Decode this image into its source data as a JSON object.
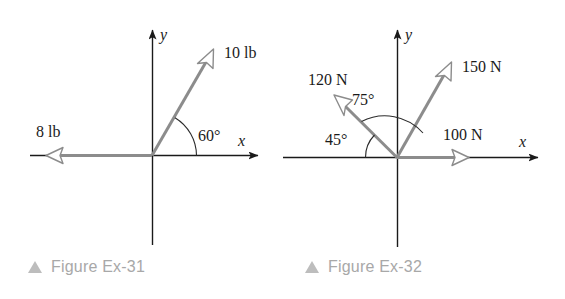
{
  "colors": {
    "axis": "#1a1a1a",
    "vector": "#8c8c8c",
    "arc": "#2b2b2b",
    "caption_text": "#a8a8a8",
    "caption_marker": "#bdbdbd",
    "background": "#ffffff",
    "label_text": "#1a1a1a"
  },
  "figures": [
    {
      "id": "figure-ex-31",
      "caption": "Figure Ex-31",
      "axes": {
        "x_label": "x",
        "y_label": "y"
      },
      "vectors": [
        {
          "name": "vector-10lb",
          "label": "10 lb",
          "magnitude": 10,
          "unit": "lb",
          "angle_deg": 60,
          "direction": "up-right"
        },
        {
          "name": "vector-8lb",
          "label": "8 lb",
          "magnitude": 8,
          "unit": "lb",
          "angle_deg": 180,
          "direction": "left"
        }
      ],
      "angles": [
        {
          "name": "angle-60",
          "label": "60°",
          "value": 60,
          "from": "positive-x-axis",
          "to": "vector-10lb"
        }
      ]
    },
    {
      "id": "figure-ex-32",
      "caption": "Figure Ex-32",
      "axes": {
        "x_label": "x",
        "y_label": "y"
      },
      "vectors": [
        {
          "name": "vector-150n",
          "label": "150 N",
          "magnitude": 150,
          "unit": "N",
          "angle_deg": 60,
          "direction": "up-right"
        },
        {
          "name": "vector-120n",
          "label": "120 N",
          "magnitude": 120,
          "unit": "N",
          "angle_deg": 135,
          "direction": "up-left"
        },
        {
          "name": "vector-100n",
          "label": "100 N",
          "magnitude": 100,
          "unit": "N",
          "angle_deg": 0,
          "direction": "right"
        }
      ],
      "angles": [
        {
          "name": "angle-75",
          "label": "75°",
          "value": 75,
          "from": "vector-150n",
          "to": "vector-120n"
        },
        {
          "name": "angle-45",
          "label": "45°",
          "value": 45,
          "from": "negative-x-axis",
          "to": "vector-120n"
        }
      ]
    }
  ]
}
